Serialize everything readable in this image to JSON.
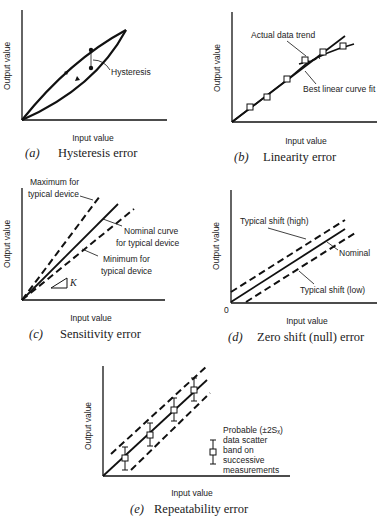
{
  "figure": {
    "panels": [
      {
        "id": "a",
        "title_letter": "(a)",
        "title": "Hysteresis error",
        "xlabel": "Input value",
        "ylabel": "Output value",
        "annotations": [
          "Hysteresis"
        ]
      },
      {
        "id": "b",
        "title_letter": "(b)",
        "title": "Linearity error",
        "xlabel": "Input value",
        "ylabel": "Output value",
        "annotations": [
          "Actual data trend",
          "Best linear curve fit"
        ]
      },
      {
        "id": "c",
        "title_letter": "(c)",
        "title": "Sensitivity error",
        "xlabel": "Input value",
        "ylabel": "Output value",
        "annotations": [
          "Maximum for",
          "typical device",
          "Nominal curve",
          "for typical device",
          "Minimum for",
          "typical device",
          "K"
        ]
      },
      {
        "id": "d",
        "title_letter": "(d)",
        "title": "Zero shift (null) error",
        "xlabel": "Input value",
        "ylabel": "Output value",
        "origin_label": "0",
        "annotations": [
          "Typical shift (high)",
          "Nominal",
          "Typical shift (low)"
        ]
      },
      {
        "id": "e",
        "title_letter": "(e)",
        "title": "Repeatability error",
        "xlabel": "Input value",
        "ylabel": "Output value",
        "legend": [
          "Probable (±2Sₓ)",
          "data scatter",
          "band on",
          "successive",
          "measurements"
        ]
      }
    ]
  }
}
